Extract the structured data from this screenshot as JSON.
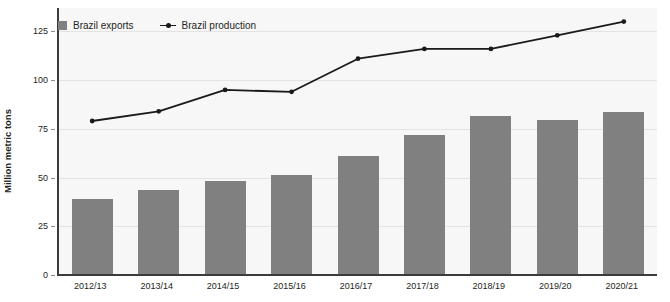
{
  "chart_data": {
    "type": "bar",
    "title": "",
    "xlabel": "",
    "ylabel": "Million metric tons",
    "ylim": [
      0,
      137
    ],
    "yticks": [
      0,
      25,
      50,
      75,
      100,
      125
    ],
    "grid": true,
    "legend_position": "top-left",
    "categories": [
      "2012/13",
      "2013/14",
      "2014/15",
      "2015/16",
      "2016/17",
      "2017/18",
      "2018/19",
      "2019/20",
      "2020/21"
    ],
    "series": [
      {
        "name": "Brazil exports",
        "type": "bar",
        "color": "#808080",
        "values": [
          39,
          43.5,
          48,
          51.5,
          61,
          72,
          81.5,
          79.5,
          83.5
        ]
      },
      {
        "name": "Brazil production",
        "type": "line",
        "color": "#1a1a1a",
        "values": [
          79,
          84,
          95,
          94,
          111,
          116,
          116,
          123,
          130
        ]
      }
    ]
  },
  "legend": {
    "items": [
      {
        "label": "Brazil exports",
        "marker": "square-swatch-icon"
      },
      {
        "label": "Brazil production",
        "marker": "line-marker-icon"
      }
    ]
  },
  "axes": {
    "y_title": "Million metric tons",
    "y_tick_labels": [
      "0",
      "25",
      "50",
      "75",
      "100",
      "125"
    ],
    "x_tick_labels": [
      "2012/13",
      "2013/14",
      "2014/15",
      "2015/16",
      "2016/17",
      "2017/18",
      "2018/19",
      "2019/20",
      "2020/21"
    ]
  },
  "colors": {
    "bar": "#808080",
    "line": "#1a1a1a",
    "plot_background": "#f7f7f7",
    "gridline": "#e3e3e3",
    "axis": "#3b3b3b"
  }
}
